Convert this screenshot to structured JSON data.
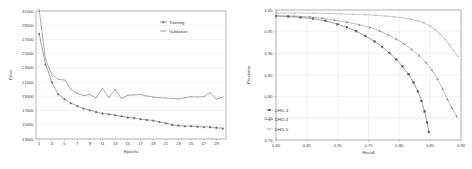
{
  "figure": {
    "panel_count": 2,
    "background": "#ffffff"
  },
  "left_panel": {
    "name": "training-validation-error-chart"
  },
  "right_panel": {
    "name": "precision-recall-chart"
  },
  "chart_data": [
    {
      "type": "line",
      "title": "",
      "xlabel": "Epochs",
      "ylabel": "Error",
      "xlim": [
        0.5,
        30.5
      ],
      "ylim": [
        13000,
        31000
      ],
      "ytick_step": 2000,
      "yticks": [
        13000,
        15000,
        17000,
        19000,
        21000,
        23000,
        25000,
        27000,
        29000,
        31000
      ],
      "ytick_labels": [
        "13000",
        "15000",
        "17000",
        "19000",
        "21000",
        "23000",
        "25000",
        "27000",
        "29000",
        "31000"
      ],
      "xticks": [
        1,
        3,
        5,
        7,
        9,
        11,
        13,
        15,
        17,
        19,
        21,
        23,
        25,
        27,
        29
      ],
      "xtick_labels": [
        "1",
        "3",
        "5",
        "7",
        "9",
        "11",
        "13",
        "15",
        "17",
        "19",
        "21",
        "23",
        "25",
        "27",
        "29"
      ],
      "grid": true,
      "grid_axis": "y",
      "legend_position": "top-right",
      "x": [
        1,
        2,
        3,
        4,
        5,
        6,
        7,
        8,
        9,
        10,
        11,
        12,
        13,
        14,
        15,
        16,
        17,
        18,
        19,
        20,
        21,
        22,
        23,
        24,
        25,
        26,
        27,
        28,
        29,
        30
      ],
      "series": [
        {
          "name": "Training",
          "color": "#5a5a5a",
          "marker": "triangle",
          "values": [
            27800,
            23500,
            21000,
            19300,
            18600,
            18050,
            17650,
            17300,
            17050,
            16800,
            16600,
            16500,
            16350,
            16200,
            16050,
            15950,
            15800,
            15700,
            15600,
            15400,
            15250,
            15000,
            14900,
            14800,
            14820,
            14750,
            14700,
            14680,
            14600,
            14500
          ]
        },
        {
          "name": "Validation",
          "color": "#6d6d6d",
          "marker": "dash",
          "values": [
            31200,
            24200,
            22100,
            21400,
            21300,
            20000,
            19450,
            19100,
            19250,
            18800,
            20100,
            18800,
            20000,
            18700,
            19150,
            19200,
            19250,
            19050,
            18900,
            18800,
            18750,
            18700,
            18650,
            18800,
            18950,
            18900,
            18950,
            19500,
            18600,
            18900
          ]
        }
      ]
    },
    {
      "type": "line",
      "title": "",
      "xlabel": "Recall",
      "ylabel": "Precision",
      "xlim": [
        0.6,
        0.9
      ],
      "ylim": [
        0.7,
        1.0
      ],
      "xticks": [
        0.6,
        0.65,
        0.7,
        0.75,
        0.8,
        0.85,
        0.9
      ],
      "xtick_labels": [
        "0.60",
        "0.65",
        "0.70",
        "0.75",
        "0.80",
        "0.85",
        "0.90"
      ],
      "yticks": [
        0.7,
        0.75,
        0.8,
        0.85,
        0.9,
        0.95,
        1.0
      ],
      "ytick_labels": [
        "0.70",
        "0.75",
        "0.80",
        "0.85",
        "0.90",
        "0.95",
        "1.00"
      ],
      "grid": true,
      "grid_axis": "both",
      "legend_position": "lower-left",
      "series": [
        {
          "name": "DHD-3",
          "color": "#555555",
          "marker": "square",
          "x": [
            0.6,
            0.62,
            0.64,
            0.66,
            0.68,
            0.7,
            0.715,
            0.73,
            0.745,
            0.76,
            0.772,
            0.784,
            0.795,
            0.805,
            0.815,
            0.823,
            0.83,
            0.836,
            0.841,
            0.845,
            0.848
          ],
          "y": [
            0.986,
            0.985,
            0.983,
            0.98,
            0.975,
            0.967,
            0.96,
            0.951,
            0.94,
            0.927,
            0.915,
            0.901,
            0.886,
            0.87,
            0.852,
            0.833,
            0.812,
            0.79,
            0.766,
            0.74,
            0.718
          ]
        },
        {
          "name": "DHD-4",
          "color": "#8c8c8c",
          "marker": "triangle",
          "x": [
            0.6,
            0.63,
            0.655,
            0.675,
            0.695,
            0.715,
            0.735,
            0.752,
            0.768,
            0.782,
            0.795,
            0.808,
            0.82,
            0.832,
            0.843,
            0.853,
            0.862,
            0.87,
            0.878,
            0.885,
            0.893
          ],
          "y": [
            0.987,
            0.986,
            0.984,
            0.981,
            0.977,
            0.972,
            0.966,
            0.96,
            0.952,
            0.943,
            0.933,
            0.922,
            0.909,
            0.895,
            0.879,
            0.861,
            0.841,
            0.818,
            0.794,
            0.774,
            0.755
          ]
        },
        {
          "name": "DHD-5",
          "color": "#9a9a9a",
          "marker": "cross",
          "x": [
            0.6,
            0.63,
            0.66,
            0.685,
            0.705,
            0.725,
            0.745,
            0.762,
            0.778,
            0.792,
            0.805,
            0.818,
            0.83,
            0.84,
            0.85,
            0.858,
            0.866,
            0.874,
            0.881,
            0.888,
            0.895
          ],
          "y": [
            0.993,
            0.993,
            0.993,
            0.992,
            0.991,
            0.99,
            0.989,
            0.988,
            0.986,
            0.984,
            0.982,
            0.979,
            0.975,
            0.97,
            0.963,
            0.955,
            0.945,
            0.933,
            0.92,
            0.906,
            0.893
          ]
        }
      ]
    }
  ]
}
